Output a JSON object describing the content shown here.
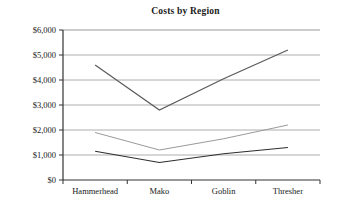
{
  "chart_data": {
    "type": "line",
    "title": "Costs by Region",
    "xlabel": "",
    "ylabel": "",
    "categories": [
      "Hammerhead",
      "Mako",
      "Goblin",
      "Thresher"
    ],
    "series": [
      {
        "name": "series-1",
        "values": [
          4600,
          2800,
          4050,
          5200
        ],
        "color": "#5a5a5a"
      },
      {
        "name": "series-2",
        "values": [
          1900,
          1200,
          1650,
          2200
        ],
        "color": "#9a9a9a"
      },
      {
        "name": "series-3",
        "values": [
          1150,
          700,
          1050,
          1300
        ],
        "color": "#2e2e2e"
      }
    ],
    "ylim": [
      0,
      6000
    ],
    "ytick_values": [
      0,
      1000,
      2000,
      3000,
      4000,
      5000,
      6000
    ],
    "ytick_labels": [
      "$0",
      "$1,000",
      "$2,000",
      "$3,000",
      "$4,000",
      "$5,000",
      "$6,000"
    ],
    "grid": true,
    "grid_color": "#999999",
    "legend": "none",
    "axis_color": "#333333"
  }
}
